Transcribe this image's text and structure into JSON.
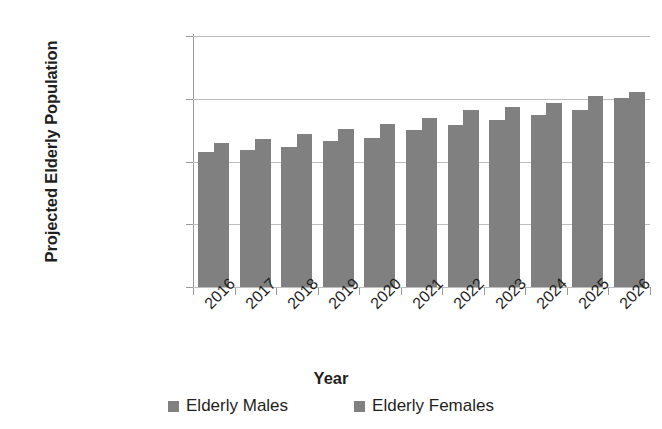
{
  "chart_data": {
    "type": "bar",
    "title": "",
    "xlabel": "Year",
    "ylabel": "Projected Elderly Population",
    "categories": [
      "2016",
      "2017",
      "2018",
      "2019",
      "2020",
      "2021",
      "2022",
      "2023",
      "2024",
      "2025",
      "2026"
    ],
    "series": [
      {
        "name": "Elderly Males",
        "color": "#808080",
        "values": [
          430000,
          437000,
          446000,
          465000,
          475000,
          500000,
          516000,
          532000,
          548000,
          564000,
          602000
        ]
      },
      {
        "name": "Elderly Females",
        "color": "#808080",
        "values": [
          459000,
          471000,
          487000,
          503000,
          519000,
          538000,
          564000,
          573000,
          586000,
          608000,
          621000
        ]
      }
    ],
    "ylim": [
      0,
      800000
    ],
    "y_ticks": [
      0,
      200000,
      400000,
      600000,
      800000
    ],
    "y_tick_labels": [
      "0",
      "200,000",
      "400,000",
      "600,000",
      "800,000"
    ],
    "grid": "horizontal",
    "legend_position": "bottom",
    "x_tick_label_rotation": -45
  },
  "axes": {
    "y_title": "Projected Elderly Population",
    "x_title": "Year"
  },
  "legend": {
    "entries": [
      {
        "label": "Elderly Males"
      },
      {
        "label": "Elderly Females"
      }
    ]
  },
  "colors": {
    "bar": "#808080",
    "gridline": "#bdbdbd",
    "axis": "#9a9a9a",
    "text": "#1f1f1f",
    "background": "#ffffff"
  }
}
